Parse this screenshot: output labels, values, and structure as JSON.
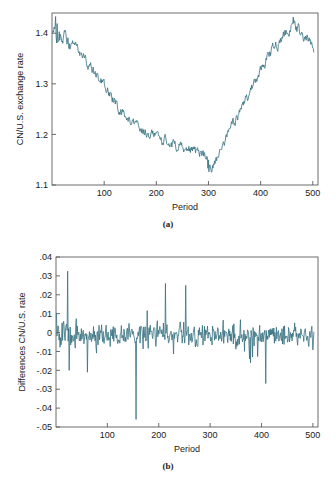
{
  "figures": [
    {
      "id": "a",
      "caption": "(a)",
      "chart_index": 0
    },
    {
      "id": "b",
      "caption": "(b)",
      "chart_index": 1
    }
  ],
  "chart_data": [
    {
      "type": "line",
      "title": "",
      "xlabel": "Period",
      "ylabel": "CN/U.S. exchange rate",
      "xlim": [
        0,
        510
      ],
      "ylim": [
        1.1,
        1.44
      ],
      "xticks": [
        100,
        200,
        300,
        400,
        500
      ],
      "xticklabels": [
        "100",
        "200",
        "300",
        "400",
        "500"
      ],
      "yticks": [
        1.1,
        1.2,
        1.3,
        1.4
      ],
      "yticklabels": [
        "1.1",
        "1.2",
        "1.3",
        "1.4"
      ],
      "grid": false,
      "legend": null,
      "line_color": "#35707f",
      "x": [
        1,
        4,
        7,
        10,
        13,
        16,
        19,
        22,
        25,
        28,
        31,
        34,
        37,
        40,
        43,
        46,
        49,
        52,
        55,
        58,
        61,
        64,
        67,
        70,
        73,
        76,
        79,
        82,
        85,
        88,
        91,
        94,
        97,
        100,
        103,
        106,
        109,
        112,
        115,
        118,
        121,
        124,
        127,
        130,
        133,
        136,
        139,
        142,
        145,
        148,
        151,
        154,
        157,
        160,
        163,
        166,
        169,
        172,
        175,
        178,
        181,
        184,
        187,
        190,
        193,
        196,
        199,
        202,
        205,
        208,
        211,
        214,
        217,
        220,
        223,
        226,
        229,
        232,
        235,
        238,
        241,
        244,
        247,
        250,
        253,
        256,
        259,
        262,
        265,
        268,
        271,
        274,
        277,
        280,
        283,
        286,
        289,
        292,
        295,
        298,
        301,
        304,
        307,
        310,
        313,
        316,
        319,
        322,
        325,
        328,
        331,
        334,
        337,
        340,
        343,
        346,
        349,
        352,
        355,
        358,
        361,
        364,
        367,
        370,
        373,
        376,
        379,
        382,
        385,
        388,
        391,
        394,
        397,
        400,
        403,
        406,
        409,
        412,
        415,
        418,
        421,
        424,
        427,
        430,
        433,
        436,
        439,
        442,
        445,
        448,
        451,
        454,
        457,
        460,
        463,
        466,
        469,
        472,
        475,
        478,
        481,
        484,
        487,
        490,
        493,
        496,
        499,
        502,
        505
      ],
      "values": [
        1.4,
        1.418,
        1.432,
        1.405,
        1.425,
        1.398,
        1.412,
        1.396,
        1.404,
        1.392,
        1.386,
        1.396,
        1.38,
        1.392,
        1.378,
        1.388,
        1.376,
        1.386,
        1.372,
        1.382,
        1.379,
        1.386,
        1.381,
        1.385,
        1.378,
        1.372,
        1.378,
        1.368,
        1.358,
        1.348,
        1.352,
        1.338,
        1.33,
        1.344,
        1.336,
        1.322,
        1.31,
        1.322,
        1.33,
        1.318,
        1.326,
        1.314,
        1.322,
        1.31,
        1.3,
        1.308,
        1.296,
        1.306,
        1.29,
        1.298,
        1.285,
        1.292,
        1.278,
        1.286,
        1.274,
        1.28,
        1.268,
        1.274,
        1.262,
        1.27,
        1.256,
        1.264,
        1.25,
        1.258,
        1.246,
        1.252,
        1.242,
        1.25,
        1.238,
        1.244,
        1.232,
        1.24,
        1.228,
        1.236,
        1.222,
        1.23,
        1.218,
        1.226,
        1.214,
        1.22,
        1.21,
        1.218,
        1.206,
        1.214,
        1.202,
        1.21,
        1.198,
        1.206,
        1.194,
        1.202,
        1.19,
        1.198,
        1.186,
        1.194,
        1.184,
        1.192,
        1.18,
        1.188,
        1.176,
        1.184,
        1.172,
        1.18,
        1.17,
        1.178,
        1.168,
        1.176,
        1.166,
        1.174,
        1.164,
        1.172,
        1.162,
        1.17,
        1.168,
        1.174,
        1.166,
        1.172,
        1.16,
        1.168,
        1.158,
        1.166,
        1.154,
        1.162,
        1.15,
        1.158,
        1.146,
        1.154,
        1.142,
        1.152,
        1.148,
        1.156,
        1.152,
        1.16,
        1.156,
        1.164,
        1.16,
        1.168,
        1.164,
        1.172,
        1.168,
        1.176,
        1.172,
        1.18,
        1.176,
        1.184,
        1.18,
        1.188,
        1.184,
        1.192,
        1.188,
        1.196,
        1.192,
        1.2,
        1.196,
        1.204,
        1.2,
        1.208,
        1.206,
        1.214,
        1.21,
        1.218,
        1.214,
        1.222,
        1.218,
        1.226,
        1.222,
        1.23
      ]
    },
    {
      "type": "line",
      "title": "",
      "xlabel": "Period",
      "ylabel": "Differences CN/U.S. rate",
      "xlim": [
        0,
        510
      ],
      "ylim": [
        -0.05,
        0.04
      ],
      "xticks": [
        100,
        200,
        300,
        400,
        500
      ],
      "xticklabels": [
        "100",
        "200",
        "300",
        "400",
        "500"
      ],
      "yticks": [
        0.04,
        0.03,
        0.02,
        0.01,
        0,
        -0.01,
        -0.02,
        -0.03,
        -0.04,
        -0.05
      ],
      "yticklabels": [
        ".04",
        ".03",
        ".02",
        ".01",
        "0",
        "-.01",
        "-.02",
        "-.03",
        "-.04",
        "-.05"
      ],
      "grid": false,
      "legend": null,
      "line_color": "#35707f",
      "notable_points": [
        {
          "x": 157,
          "y": -0.046,
          "note": "largest negative spike"
        },
        {
          "x": 22,
          "y": 0.0325,
          "note": "largest positive spike"
        },
        {
          "x": 215,
          "y": 0.026,
          "note": "positive spike"
        },
        {
          "x": 255,
          "y": 0.025,
          "note": "positive spike"
        },
        {
          "x": 413,
          "y": -0.027,
          "note": "negative spike"
        },
        {
          "x": 61,
          "y": -0.021,
          "note": "negative spike"
        },
        {
          "x": 25,
          "y": -0.02,
          "note": "negative spike"
        }
      ],
      "mean": -0.0013,
      "stdev": 0.0075,
      "n": 509
    }
  ]
}
